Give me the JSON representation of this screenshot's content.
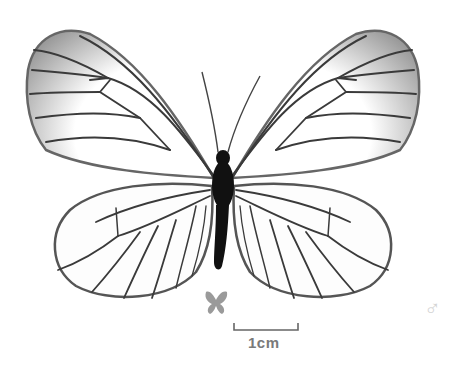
{
  "specimen": {
    "subject": "butterfly specimen, dorsal view",
    "sex_symbol": "♂",
    "scale_bar_label": "1cm",
    "size_icon": "small-butterfly-icon"
  },
  "colors": {
    "background": "#ffffff",
    "vein": "#3a3a3a",
    "wing_margin": "#8a8a8a",
    "body": "#111111",
    "scale_text": "#7a7a7a",
    "size_icon": "#9a9a9a",
    "sex_symbol": "#d4d4d4"
  }
}
